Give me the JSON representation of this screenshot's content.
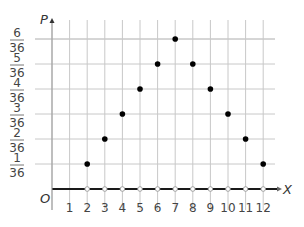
{
  "chart_data": {
    "type": "scatter",
    "title": "",
    "xlabel": "X",
    "ylabel": "P",
    "origin_label": "O",
    "x": [
      2,
      3,
      4,
      5,
      6,
      7,
      8,
      9,
      10,
      11,
      12
    ],
    "values": [
      0.02778,
      0.05556,
      0.08333,
      0.11111,
      0.13889,
      0.16667,
      0.13889,
      0.11111,
      0.08333,
      0.05556,
      0.02778
    ],
    "values_fraction": [
      "1/36",
      "2/36",
      "3/36",
      "4/36",
      "5/36",
      "6/36",
      "5/36",
      "4/36",
      "3/36",
      "2/36",
      "1/36"
    ],
    "x_ticks": [
      "1",
      "2",
      "3",
      "4",
      "5",
      "6",
      "7",
      "8",
      "9",
      "10",
      "11",
      "12"
    ],
    "y_ticks": [
      {
        "num": "1",
        "den": "36"
      },
      {
        "num": "2",
        "den": "36"
      },
      {
        "num": "3",
        "den": "36"
      },
      {
        "num": "4",
        "den": "36"
      },
      {
        "num": "5",
        "den": "36"
      },
      {
        "num": "6",
        "den": "36"
      }
    ],
    "xlim": [
      0,
      12.5
    ],
    "ylim": [
      0,
      0.1667
    ],
    "grid": true,
    "legend": null,
    "axis_open_points_x": [
      2,
      3,
      4,
      5,
      6,
      7,
      8,
      9,
      10,
      11,
      12
    ],
    "colors": {
      "grid": "#c8c8c8",
      "points": "#000000",
      "axis": "#1a1a1a"
    }
  }
}
